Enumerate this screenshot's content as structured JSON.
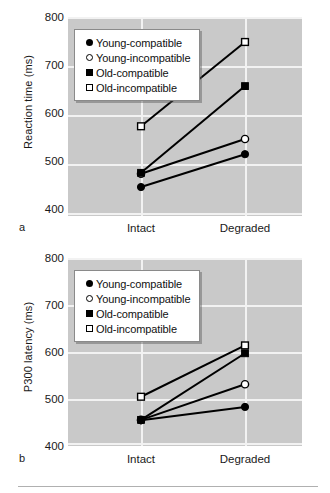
{
  "figure": {
    "background": "#ffffff",
    "plot_background": "#c9c9c9",
    "gridline_color": "#f2f2f2",
    "series_color": "#000000"
  },
  "panels": [
    {
      "letter": "a",
      "ylabel": "Reaction time (ms)",
      "yticks": [
        "800",
        "700",
        "600",
        "500",
        "400"
      ],
      "xticks": [
        "Intact",
        "Degraded"
      ]
    },
    {
      "letter": "b",
      "ylabel": "P300 latency (ms)",
      "yticks": [
        "800",
        "700",
        "600",
        "500",
        "400"
      ],
      "xticks": [
        "Intact",
        "Degraded"
      ]
    }
  ],
  "legend": {
    "entries": [
      {
        "label": "Young-compatible",
        "marker": "filled-circle"
      },
      {
        "label": "Young-incompatible",
        "marker": "open-circle"
      },
      {
        "label": "Old-compatible",
        "marker": "filled-square"
      },
      {
        "label": "Old-incompatible",
        "marker": "open-square"
      }
    ]
  },
  "chart_data": [
    {
      "type": "line",
      "panel": "a",
      "title": "Reaction time (ms) by stimulus quality",
      "xlabel": "",
      "ylabel": "Reaction time (ms)",
      "categories": [
        "Intact",
        "Degraded"
      ],
      "ylim": [
        400,
        800
      ],
      "yticks": [
        400,
        500,
        600,
        700,
        800
      ],
      "grid": true,
      "legend_position": "upper-left",
      "series": [
        {
          "name": "Young-compatible",
          "marker": "filled-circle",
          "values": [
            453,
            520
          ]
        },
        {
          "name": "Young-incompatible",
          "marker": "open-circle",
          "values": [
            480,
            551
          ]
        },
        {
          "name": "Old-compatible",
          "marker": "filled-square",
          "values": [
            482,
            659
          ]
        },
        {
          "name": "Old-incompatible",
          "marker": "open-square",
          "values": [
            577,
            749
          ]
        }
      ]
    },
    {
      "type": "line",
      "panel": "b",
      "title": "P300 latency (ms) by stimulus quality",
      "xlabel": "",
      "ylabel": "P300 latency (ms)",
      "categories": [
        "Intact",
        "Degraded"
      ],
      "ylim": [
        400,
        800
      ],
      "yticks": [
        400,
        500,
        600,
        700,
        800
      ],
      "grid": true,
      "legend_position": "upper-left",
      "series": [
        {
          "name": "Young-compatible",
          "marker": "filled-circle",
          "values": [
            449,
            478
          ]
        },
        {
          "name": "Young-incompatible",
          "marker": "open-circle",
          "values": [
            450,
            527
          ]
        },
        {
          "name": "Old-compatible",
          "marker": "filled-square",
          "values": [
            450,
            594
          ]
        },
        {
          "name": "Old-incompatible",
          "marker": "open-square",
          "values": [
            500,
            611
          ]
        }
      ]
    }
  ]
}
